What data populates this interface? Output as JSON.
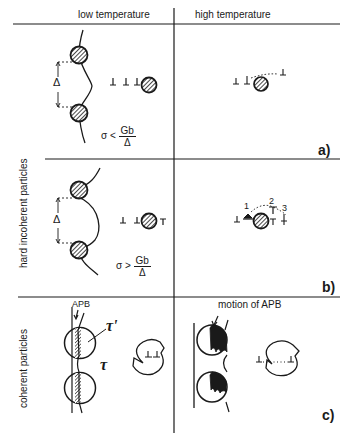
{
  "headers": {
    "left": "low temperature",
    "right": "high temperature"
  },
  "row_labels": {
    "incoherent": "hard  incoherent  particles",
    "coherent": "coherent  particles"
  },
  "panels": {
    "a": {
      "label": "a)",
      "spacing_symbol": "Δ",
      "condition": {
        "lhs": "σ",
        "op": "<",
        "num": "Gb",
        "den": "Δ"
      }
    },
    "b": {
      "label": "b)",
      "spacing_symbol": "Δ",
      "condition": {
        "lhs": "σ",
        "op": ">",
        "num": "Gb",
        "den": "Δ"
      },
      "path_numbers": [
        "1",
        "2",
        "3"
      ]
    },
    "c": {
      "label": "c)",
      "apb_label": "APB",
      "motion_label": "motion  of  APB",
      "tau_prime": "τ'",
      "tau": "τ"
    }
  },
  "colors": {
    "ink": "#1a1a1a",
    "background": "#ffffff"
  }
}
